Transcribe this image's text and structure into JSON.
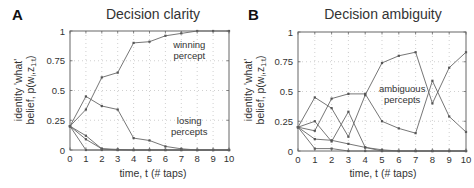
{
  "panels": [
    {
      "letter": "A",
      "title": "Decision clarity",
      "ylabel_line1": "identity 'what'",
      "ylabel_line2": "belief, p(w",
      "ylabel_sub_i": "i",
      "ylabel_z": ",z",
      "ylabel_sub_t": "1:t",
      "ylabel_close": ")",
      "xlabel": "time, t (# taps)",
      "annotations": [
        {
          "lines": [
            "winning",
            "percept"
          ],
          "t": 7.5,
          "y": 0.86
        },
        {
          "lines": [
            "losing",
            "percepts"
          ],
          "t": 7.5,
          "y": 0.22
        }
      ]
    },
    {
      "letter": "B",
      "title": "Decision ambiguity",
      "ylabel_line1": "identity 'what'",
      "ylabel_line2": "belief, p(w",
      "ylabel_sub_i": "i",
      "ylabel_z": ",z",
      "ylabel_sub_t": "1:t",
      "ylabel_close": ")",
      "xlabel": "time, t (# taps)",
      "annotations": [
        {
          "lines": [
            "ambiguous",
            "percepts"
          ],
          "t": 6.2,
          "y": 0.5
        }
      ]
    }
  ],
  "chart_data": [
    {
      "type": "line",
      "title": "Decision clarity",
      "panel": "A",
      "xlabel": "time, t (# taps)",
      "ylabel": "identity 'what' belief, p(w_i, z_1:t)",
      "x": [
        0,
        1,
        2,
        3,
        4,
        5,
        6,
        7,
        8,
        9,
        10
      ],
      "xticks": [
        "0",
        "1",
        "2",
        "3",
        "4",
        "5",
        "6",
        "7",
        "8",
        "9",
        "10"
      ],
      "yticks": [
        "0",
        "0.25",
        "0.5",
        "0.75",
        "1"
      ],
      "xlim": [
        0,
        10
      ],
      "ylim": [
        0,
        1
      ],
      "grid": true,
      "series": [
        {
          "name": "winning percept",
          "values": [
            0.2,
            0.34,
            0.61,
            0.65,
            0.9,
            0.91,
            0.96,
            0.98,
            1.0,
            1.0,
            1.0
          ]
        },
        {
          "name": "losing percept 1",
          "values": [
            0.2,
            0.45,
            0.37,
            0.34,
            0.1,
            0.08,
            0.03,
            0.01,
            0.0,
            0.0,
            0.0
          ]
        },
        {
          "name": "losing percept 2",
          "values": [
            0.2,
            0.12,
            0.01,
            0.005,
            0.0,
            0.0,
            0.0,
            0.0,
            0.0,
            0.0,
            0.0
          ]
        },
        {
          "name": "losing percept 3",
          "values": [
            0.2,
            0.09,
            0.01,
            0.0,
            0.0,
            0.0,
            0.0,
            0.0,
            0.0,
            0.0,
            0.0
          ]
        },
        {
          "name": "losing percept 4",
          "values": [
            0.2,
            0.0,
            0.0,
            0.0,
            0.0,
            0.0,
            0.0,
            0.0,
            0.0,
            0.0,
            0.0
          ]
        }
      ],
      "annotations": [
        "winning percept",
        "losing percepts"
      ]
    },
    {
      "type": "line",
      "title": "Decision ambiguity",
      "panel": "B",
      "xlabel": "time, t (# taps)",
      "ylabel": "identity 'what' belief, p(w_i, z_1:t)",
      "x": [
        0,
        1,
        2,
        3,
        4,
        5,
        6,
        7,
        8,
        9,
        10
      ],
      "xticks": [
        "0",
        "1",
        "2",
        "3",
        "4",
        "5",
        "6",
        "7",
        "8",
        "9",
        "10"
      ],
      "yticks": [
        "0",
        "0.25",
        "0.5",
        "0.75",
        "1"
      ],
      "xlim": [
        0,
        10
      ],
      "ylim": [
        0,
        1
      ],
      "grid": true,
      "series": [
        {
          "name": "ambiguous percept 1",
          "values": [
            0.2,
            0.45,
            0.36,
            0.12,
            0.47,
            0.74,
            0.8,
            0.83,
            0.4,
            0.7,
            0.83
          ]
        },
        {
          "name": "ambiguous percept 2",
          "values": [
            0.2,
            0.17,
            0.44,
            0.48,
            0.48,
            0.25,
            0.19,
            0.15,
            0.59,
            0.29,
            0.16
          ]
        },
        {
          "name": "percept 3",
          "values": [
            0.2,
            0.25,
            0.08,
            0.33,
            0.03,
            0.01,
            0.0,
            0.0,
            0.0,
            0.0,
            0.0
          ]
        },
        {
          "name": "percept 4",
          "values": [
            0.2,
            0.1,
            0.09,
            0.06,
            0.03,
            0.0,
            0.0,
            0.0,
            0.0,
            0.0,
            0.0
          ]
        },
        {
          "name": "percept 5",
          "values": [
            0.2,
            0.02,
            0.02,
            0.0,
            0.0,
            0.0,
            0.0,
            0.0,
            0.0,
            0.0,
            0.0
          ]
        }
      ],
      "annotations": [
        "ambiguous percepts"
      ]
    }
  ]
}
